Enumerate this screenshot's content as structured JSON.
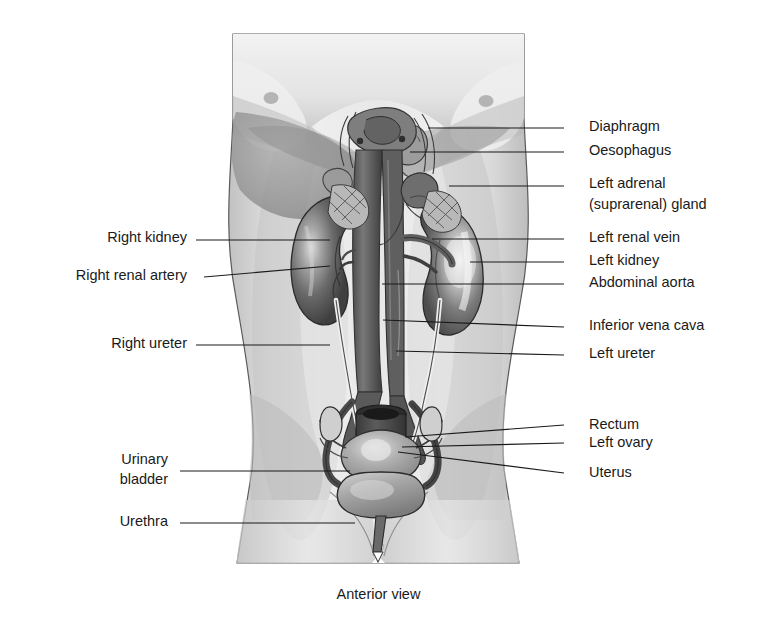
{
  "figure": {
    "title": "Anterior view",
    "view_caption": "Anterior view",
    "background_color": "#ffffff",
    "line_color": "#1a1a1a",
    "palette": {
      "skin_light": "#e8e8e8",
      "skin_mid": "#cfcfcf",
      "skin_shadow": "#a8a8a8",
      "organ_dark": "#4a4a4a",
      "organ_mid": "#6e6e6e",
      "organ_light": "#b9b9b9",
      "vessel": "#5a5a5a",
      "outline": "#2b2b2b"
    }
  },
  "labels_right": [
    {
      "id": "diaphragm",
      "text": "Diaphragm",
      "text_x": 589,
      "text_y": 121,
      "line_x1": 564,
      "line_y1": 128,
      "line_x2": 428,
      "line_y2": 128
    },
    {
      "id": "oesophagus",
      "text": "Oesophagus",
      "text_x": 589,
      "text_y": 145,
      "line_x1": 564,
      "line_y1": 152,
      "line_x2": 410,
      "line_y2": 152
    },
    {
      "id": "left-adrenal",
      "text": "Left adrenal",
      "text_x": 589,
      "text_y": 178,
      "line_x1": 564,
      "line_y1": 186,
      "line_x2": 449,
      "line_y2": 186
    },
    {
      "id": "left-adrenal2",
      "text": "(suprarenal) gland",
      "text_x": 589,
      "text_y": 199,
      "line_x1": 0,
      "line_y1": 0,
      "line_x2": 0,
      "line_y2": 0
    },
    {
      "id": "left-renal-vein",
      "text": "Left renal vein",
      "text_x": 589,
      "text_y": 232,
      "line_x1": 564,
      "line_y1": 239,
      "line_x2": 432,
      "line_y2": 239
    },
    {
      "id": "left-kidney",
      "text": "Left kidney",
      "text_x": 589,
      "text_y": 255,
      "line_x1": 564,
      "line_y1": 262,
      "line_x2": 470,
      "line_y2": 262
    },
    {
      "id": "abdominal-aorta",
      "text": "Abdominal aorta",
      "text_x": 589,
      "text_y": 277,
      "line_x1": 564,
      "line_y1": 284,
      "line_x2": 382,
      "line_y2": 284
    },
    {
      "id": "inferior-vena-cava",
      "text": "Inferior vena cava",
      "text_x": 589,
      "text_y": 320,
      "line_x1": 564,
      "line_y1": 327,
      "line_x2": 383,
      "line_y2": 320
    },
    {
      "id": "left-ureter",
      "text": "Left ureter",
      "text_x": 589,
      "text_y": 348,
      "line_x1": 564,
      "line_y1": 355,
      "line_x2": 396,
      "line_y2": 351
    },
    {
      "id": "rectum",
      "text": "Rectum",
      "text_x": 589,
      "text_y": 419,
      "line_x1": 564,
      "line_y1": 425,
      "line_x2": 405,
      "line_y2": 437
    },
    {
      "id": "left-ovary",
      "text": "Left ovary",
      "text_x": 589,
      "text_y": 437,
      "line_x1": 564,
      "line_y1": 443,
      "line_x2": 402,
      "line_y2": 447
    },
    {
      "id": "uterus",
      "text": "Uterus",
      "text_x": 589,
      "text_y": 467,
      "line_x1": 564,
      "line_y1": 473,
      "line_x2": 398,
      "line_y2": 452
    }
  ],
  "labels_left": [
    {
      "id": "right-kidney",
      "text": "Right kidney",
      "text_x": 187,
      "text_y": 232,
      "line_x1": 196,
      "line_y1": 240,
      "line_x2": 330,
      "line_y2": 240
    },
    {
      "id": "right-renal-artery",
      "text": "Right renal artery",
      "text_x": 187,
      "text_y": 270,
      "line_x1": 204,
      "line_y1": 277,
      "line_x2": 330,
      "line_y2": 266
    },
    {
      "id": "right-ureter",
      "text": "Right ureter",
      "text_x": 187,
      "text_y": 338,
      "line_x1": 196,
      "line_y1": 345,
      "line_x2": 330,
      "line_y2": 345
    },
    {
      "id": "urinary-bladder",
      "text": "Urinary",
      "text_x": 168,
      "text_y": 454,
      "line_x1": 0,
      "line_y1": 0,
      "line_x2": 0,
      "line_y2": 0
    },
    {
      "id": "urinary-bladder2",
      "text": "bladder",
      "text_x": 168,
      "text_y": 474,
      "line_x1": 180,
      "line_y1": 471,
      "line_x2": 350,
      "line_y2": 471
    },
    {
      "id": "urethra",
      "text": "Urethra",
      "text_x": 168,
      "text_y": 516,
      "line_x1": 180,
      "line_y1": 523,
      "line_x2": 355,
      "line_y2": 523
    }
  ],
  "structures": [
    "Diaphragm",
    "Oesophagus",
    "Left adrenal (suprarenal) gland",
    "Left renal vein",
    "Left kidney",
    "Abdominal aorta",
    "Inferior vena cava",
    "Left ureter",
    "Rectum",
    "Left ovary",
    "Uterus",
    "Right kidney",
    "Right renal artery",
    "Right ureter",
    "Urinary bladder",
    "Urethra"
  ]
}
